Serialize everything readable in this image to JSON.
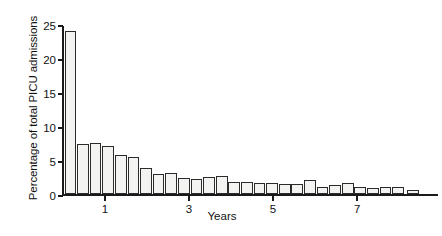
{
  "chart_data": {
    "type": "bar",
    "title": "",
    "subtitle": "",
    "xlabel": "Years",
    "ylabel": "Percentage of total PICU admissions",
    "xlim": [
      0,
      8.95
    ],
    "ylim": [
      0,
      25
    ],
    "grid": false,
    "legend": null,
    "bar_width_years": 0.28,
    "x_tick_values": [
      1,
      3,
      5,
      7
    ],
    "x_tick_labels": [
      "1",
      "3",
      "5",
      "7"
    ],
    "y_tick_values": [
      0,
      5,
      10,
      15,
      20,
      25
    ],
    "y_tick_labels": [
      "0",
      "5",
      "10",
      "15",
      "20",
      "25"
    ],
    "x": [
      0.2,
      0.5,
      0.8,
      1.1,
      1.4,
      1.7,
      2.0,
      2.3,
      2.6,
      2.9,
      3.2,
      3.5,
      3.8,
      4.1,
      4.4,
      4.7,
      5.0,
      5.3,
      5.6,
      5.9,
      6.2,
      6.5,
      6.8,
      7.1,
      7.4,
      7.7,
      8.0,
      8.35
    ],
    "values": [
      24.0,
      7.3,
      7.5,
      7.1,
      5.7,
      5.4,
      3.8,
      2.9,
      3.1,
      2.3,
      2.2,
      2.5,
      2.6,
      1.8,
      1.7,
      1.6,
      1.6,
      1.5,
      1.4,
      2.0,
      1.1,
      1.3,
      1.6,
      1.0,
      0.9,
      1.0,
      1.1,
      0.6
    ],
    "categories": [
      "0.2",
      "0.5",
      "0.8",
      "1.1",
      "1.4",
      "1.7",
      "2.0",
      "2.3",
      "2.6",
      "2.9",
      "3.2",
      "3.5",
      "3.8",
      "4.1",
      "4.4",
      "4.7",
      "5.0",
      "5.3",
      "5.6",
      "5.9",
      "6.2",
      "6.5",
      "6.8",
      "7.1",
      "7.4",
      "7.7",
      "8.0",
      "8.35"
    ],
    "series": [
      {
        "name": "Percentage of total PICU admissions",
        "values": [
          24.0,
          7.3,
          7.5,
          7.1,
          5.7,
          5.4,
          3.8,
          2.9,
          3.1,
          2.3,
          2.2,
          2.5,
          2.6,
          1.8,
          1.7,
          1.6,
          1.6,
          1.5,
          1.4,
          2.0,
          1.1,
          1.3,
          1.6,
          1.0,
          0.9,
          1.0,
          1.1,
          0.6
        ]
      }
    ],
    "colors": {
      "bar_fill": "#f3f3f1",
      "bar_edge": "#2b2b2b",
      "axis": "#1a1a1a",
      "text": "#111111",
      "background": "#ffffff"
    },
    "annotations": []
  }
}
